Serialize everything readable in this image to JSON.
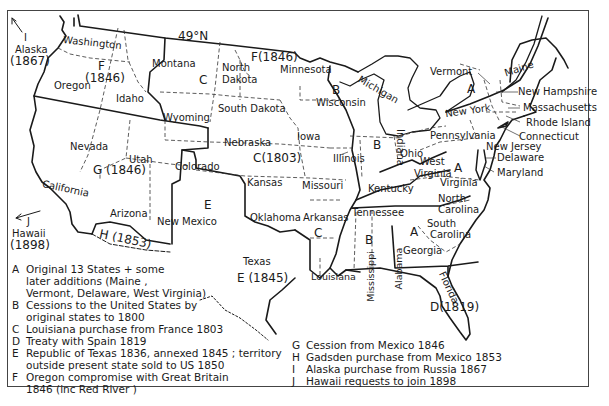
{
  "map": {
    "parallel_label": "49°N",
    "states": {
      "washington": "Washington",
      "oregon": "Oregon",
      "idaho": "Idaho",
      "montana": "Montana",
      "wyoming": "Wyoming",
      "north_dakota_1": "North",
      "north_dakota_2": "Dakota",
      "south_dakota": "South Dakota",
      "minnesota": "Minnesota",
      "wisconsin": "Wisconsin",
      "michigan": "Michigan",
      "iowa": "Iowa",
      "nebraska": "Nebraska",
      "nevada": "Nevada",
      "utah": "Utah",
      "colorado": "Colorado",
      "california": "California",
      "arizona": "Arizona",
      "new_mexico_1": "New",
      "new_mexico_2": "Mexico",
      "kansas": "Kansas",
      "oklahoma": "Oklahoma",
      "texas": "Texas",
      "missouri": "Missouri",
      "arkansas": "Arkansas",
      "louisiana": "Louisiana",
      "illinois": "Illinois",
      "indiana": "Indiana",
      "ohio": "Ohio",
      "kentucky": "Kentucky",
      "tennessee": "Tennessee",
      "mississippi": "Mississippi",
      "alabama": "Alabama",
      "georgia": "Georgia",
      "florida": "Florida",
      "south_carolina_1": "South",
      "south_carolina_2": "Carolina",
      "north_carolina_1": "North",
      "north_carolina_2": "Carolina",
      "virginia": "Virginia",
      "west_virginia_1": "West",
      "west_virginia_2": "Virginia",
      "pennsylvania": "Pennsylvania",
      "new_york": "New York",
      "vermont": "Vermont",
      "maine": "Maine",
      "new_hampshire": "New Hampshire",
      "massachusetts": "Massachusetts",
      "rhode_island": "Rhode Island",
      "connecticut": "Connecticut",
      "new_jersey": "New Jersey",
      "delaware": "Delaware",
      "maryland": "Maryland"
    },
    "region_markers": {
      "A_ny": "A",
      "A_va": "A",
      "A_ga": "A",
      "B_wi": "B",
      "B_in": "B",
      "B_al": "B",
      "C_mt": "C",
      "C_1803": "C(1803)",
      "C_ar": "C",
      "D_1819": "D(1819)",
      "E_nm": "E",
      "E_1845": "E (1845)",
      "F_1846_or_1": "F",
      "F_1846_or_2": "(1846)",
      "F_1846_mn": "F(1846)",
      "G_1846": "G (1846)",
      "H_1853": "H (1853)"
    },
    "offmap": {
      "alaska_key": "I",
      "alaska_name": "Alaska",
      "alaska_year": "(1867)",
      "hawaii_key": "J",
      "hawaii_name": "Hawaii",
      "hawaii_year": "(1898)"
    }
  },
  "legend": {
    "left": [
      {
        "key": "A",
        "lines": [
          "Original 13 States + some",
          "later additions (Maine ,",
          "Vermont, Delaware, West Virginia)"
        ]
      },
      {
        "key": "B",
        "lines": [
          "Cessions to the United States by",
          "original states to 1800"
        ]
      },
      {
        "key": "C",
        "lines": [
          "Louisiana purchase from France 1803"
        ]
      },
      {
        "key": "D",
        "lines": [
          "Treaty with Spain 1819"
        ]
      },
      {
        "key": "E",
        "lines": [
          "Republic of Texas 1836, annexed 1845 ; territory",
          "outside present state sold to US 1850"
        ]
      },
      {
        "key": "F",
        "lines": [
          "Oregon compromise with Great Britain",
          "1846 (inc Red River )"
        ]
      }
    ],
    "right": [
      {
        "key": "G",
        "lines": [
          "Cession from Mexico 1846"
        ]
      },
      {
        "key": "H",
        "lines": [
          "Gadsden purchase from Mexico 1853"
        ]
      },
      {
        "key": "I",
        "lines": [
          "Alaska purchase from Russia 1867"
        ]
      },
      {
        "key": "J",
        "lines": [
          "Hawaii requests to join 1898"
        ]
      }
    ]
  }
}
